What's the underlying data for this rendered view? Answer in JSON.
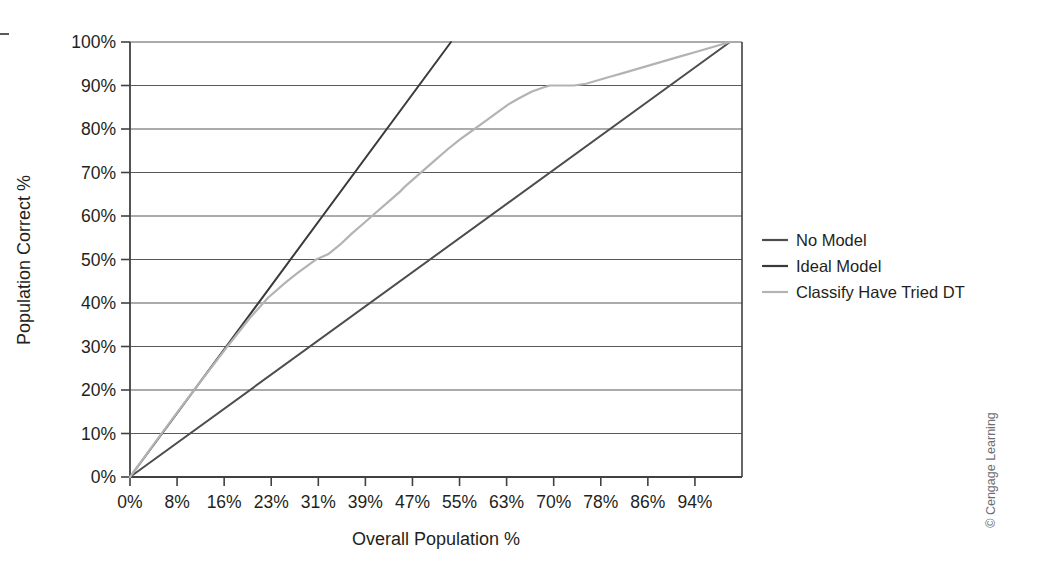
{
  "chart_data": {
    "type": "line",
    "title": "",
    "xlabel": "Overall Population %",
    "ylabel": "Population Correct %",
    "xlim": [
      0,
      102
    ],
    "ylim": [
      0,
      100
    ],
    "grid": "horizontal",
    "legend_position": "right",
    "x_tick_labels": [
      "0%",
      "8%",
      "16%",
      "23%",
      "31%",
      "39%",
      "47%",
      "55%",
      "63%",
      "70%",
      "78%",
      "86%",
      "94%"
    ],
    "x_tick_values": [
      0,
      8,
      16,
      23,
      31,
      39,
      47,
      55,
      63,
      70,
      78,
      86,
      94
    ],
    "y_tick_labels": [
      "0%",
      "10%",
      "20%",
      "30%",
      "40%",
      "50%",
      "60%",
      "70%",
      "80%",
      "90%",
      "100%"
    ],
    "y_tick_values": [
      0,
      10,
      20,
      30,
      40,
      50,
      60,
      70,
      80,
      90,
      100
    ],
    "series": [
      {
        "name": "No Model",
        "color": "#4d4d4d",
        "x": [
          0,
          100
        ],
        "values": [
          0,
          100
        ]
      },
      {
        "name": "Ideal Model",
        "color": "#3a3a3a",
        "x": [
          0,
          53.5
        ],
        "values": [
          0,
          100
        ]
      },
      {
        "name": "Classify Have Tried DT",
        "color": "#b3b3b3",
        "x": [
          0,
          4,
          8,
          12,
          16,
          20,
          23,
          26,
          28,
          30,
          31,
          33,
          35,
          37,
          39,
          41,
          43,
          45,
          46,
          47,
          49,
          51,
          53,
          55,
          57,
          59,
          61,
          63,
          65,
          67,
          69,
          70,
          72,
          74,
          76,
          78,
          80,
          82,
          84,
          86,
          88,
          90,
          92,
          94,
          96,
          98,
          100
        ],
        "values": [
          0,
          7.6,
          15.1,
          22.4,
          29.6,
          36.6,
          41.2,
          44.8,
          47.0,
          49.0,
          50.0,
          51.2,
          53.4,
          56.0,
          58.4,
          60.8,
          63.2,
          65.6,
          67.0,
          68.2,
          70.6,
          73.0,
          75.4,
          77.6,
          79.6,
          81.6,
          83.6,
          85.6,
          87.2,
          88.6,
          89.6,
          90.0,
          90.0,
          90.0,
          90.4,
          91.2,
          92.0,
          92.8,
          93.6,
          94.4,
          95.2,
          96.0,
          96.8,
          97.6,
          98.4,
          99.2,
          100
        ]
      }
    ]
  },
  "legend": {
    "items": [
      {
        "label": "No Model",
        "color": "#4d4d4d",
        "style": "solid"
      },
      {
        "label": "Ideal Model",
        "color": "#3a3a3a",
        "style": "solid"
      },
      {
        "label": "Classify Have Tried DT",
        "color": "#b3b3b3",
        "style": "solid"
      }
    ]
  },
  "axes": {
    "x_title": "Overall Population %",
    "y_title": "Population Correct %"
  },
  "credit": {
    "text": "© Cengage Learning"
  }
}
